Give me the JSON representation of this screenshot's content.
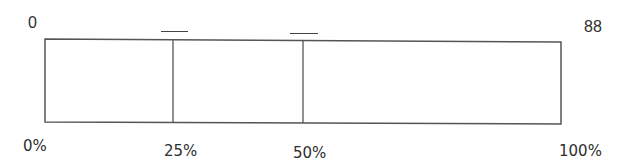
{
  "diagram": {
    "type": "number-line-bar-model",
    "top_labels": {
      "start": "0",
      "end": "88"
    },
    "bottom_labels": [
      "0%",
      "25%",
      "50%",
      "100%"
    ],
    "blanks": [
      {
        "position_percent": "25%",
        "value": ""
      },
      {
        "position_percent": "50%",
        "value": ""
      }
    ],
    "colors": {
      "stroke": "#555555",
      "text": "#2e2e2e",
      "background": "#ffffff"
    }
  }
}
